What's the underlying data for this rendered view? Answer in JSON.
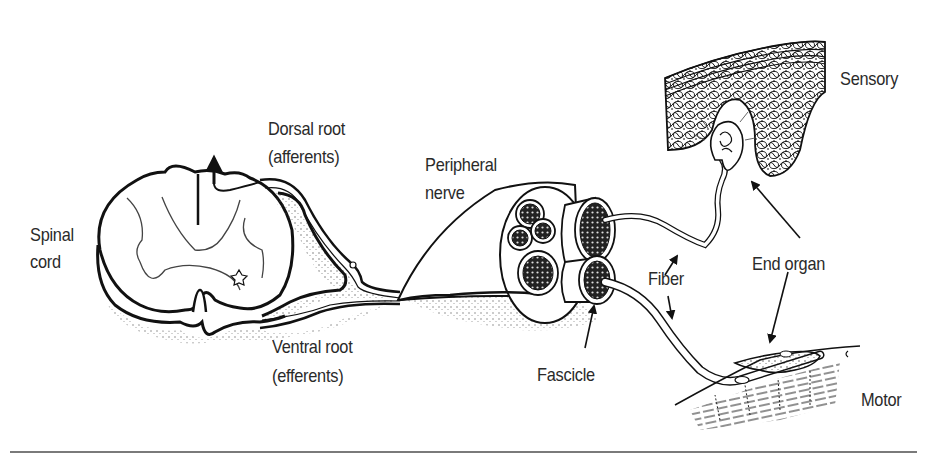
{
  "diagram": {
    "type": "anatomical-illustration",
    "labels": {
      "spinal_cord_line1": "Spinal",
      "spinal_cord_line2": "cord",
      "dorsal_root_line1": "Dorsal root",
      "dorsal_root_line2": "(afferents)",
      "ventral_root_line1": "Ventral root",
      "ventral_root_line2": "(efferents)",
      "peripheral_nerve_line1": "Peripheral",
      "peripheral_nerve_line2": "nerve",
      "fascicle": "Fascicle",
      "fiber": "Fiber",
      "end_organ": "End organ",
      "sensory": "Sensory",
      "motor": "Motor"
    },
    "colors": {
      "ink": "#111111",
      "text": "#2a2a2a",
      "rule": "#7a7a7a",
      "background": "#ffffff"
    }
  }
}
